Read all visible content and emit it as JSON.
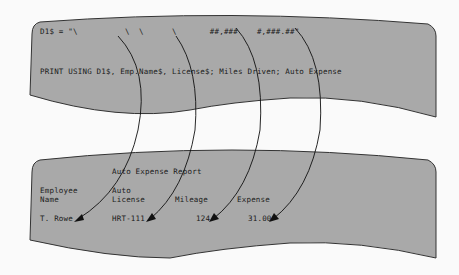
{
  "top_panel": {
    "format_line": "D1$ = \"\\          \\  \\      \\       ##,###    #,###.##\"",
    "print_line": "PRINT USING D1$, Emp.Name$, License$; Miles Driven; Auto Expense"
  },
  "bottom_panel": {
    "title": "Auto Expense Report",
    "headers": [
      {
        "line1": "Employee",
        "line2": "Name"
      },
      {
        "line1": "Auto",
        "line2": "License"
      },
      {
        "line1": "",
        "line2": "Mileage"
      },
      {
        "line1": "",
        "line2": "Expense"
      }
    ],
    "row": [
      "T. Rowe",
      "HRT-111",
      "124",
      "31.00"
    ]
  },
  "colors": {
    "panel_fill": "#a9a9a9",
    "panel_stroke": "#333333",
    "arrow": "#111111",
    "background": "#fafafa"
  }
}
